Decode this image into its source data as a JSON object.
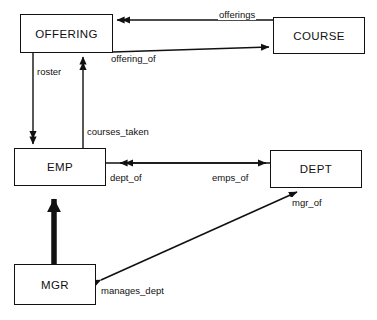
{
  "diagram": {
    "type": "functional-data-model-diagram",
    "width": 377,
    "height": 320,
    "background_color": "#ffffff",
    "line_color": "#111111",
    "entities": [
      {
        "id": "offering",
        "label": "OFFERING",
        "x": 20,
        "y": 14,
        "w": 93,
        "h": 39
      },
      {
        "id": "course",
        "label": "COURSE",
        "x": 273,
        "y": 17,
        "w": 92,
        "h": 37
      },
      {
        "id": "emp",
        "label": "EMP",
        "x": 14,
        "y": 148,
        "w": 92,
        "h": 38
      },
      {
        "id": "dept",
        "label": "DEPT",
        "x": 270,
        "y": 150,
        "w": 92,
        "h": 38
      },
      {
        "id": "mgr",
        "label": "MGR",
        "x": 14,
        "y": 264,
        "w": 82,
        "h": 41
      }
    ],
    "relationships": [
      {
        "id": "offerings",
        "label": "offerings",
        "from": "course",
        "to": "offering",
        "arrow": "double",
        "label_x": 218,
        "label_y": 9
      },
      {
        "id": "offering_of",
        "label": "offering_of",
        "from": "offering",
        "to": "course",
        "arrow": "single",
        "label_x": 110,
        "label_y": 53
      },
      {
        "id": "roster",
        "label": "roster",
        "from": "offering",
        "to": "emp",
        "arrow": "double",
        "label_x": 36,
        "label_y": 66
      },
      {
        "id": "courses_taken",
        "label": "courses_taken",
        "from": "emp",
        "to": "offering",
        "arrow": "double",
        "label_x": 86,
        "label_y": 126
      },
      {
        "id": "emps_of",
        "label": "emps_of",
        "from": "dept",
        "to": "emp",
        "arrow": "double",
        "label_x": 211,
        "label_y": 172
      },
      {
        "id": "dept_of",
        "label": "dept_of",
        "from": "emp",
        "to": "dept",
        "arrow": "single",
        "label_x": 109,
        "label_y": 172
      },
      {
        "id": "mgr_of",
        "label": "mgr_of",
        "from": "mgr",
        "to": "dept",
        "arrow": "single",
        "label_x": 291,
        "label_y": 197
      },
      {
        "id": "manages_dept",
        "label": "manages_dept",
        "from": "dept",
        "to": "mgr",
        "arrow": "single",
        "label_x": 100,
        "label_y": 285
      },
      {
        "id": "isa",
        "label": "",
        "from": "mgr",
        "to": "emp",
        "arrow": "thick",
        "label_x": 0,
        "label_y": 0
      }
    ]
  }
}
